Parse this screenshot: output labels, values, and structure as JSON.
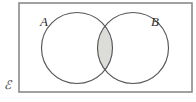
{
  "figure": {
    "kind": "venn-diagram",
    "background_color": "#ffffff"
  },
  "universe": {
    "label": "ℰ",
    "label_name": "script-capital-e",
    "meaning": "universal set",
    "border_color": "#8a8a8a",
    "fill_color": "#ffffff",
    "rect": {
      "x": 19,
      "y": 3,
      "width": 173,
      "height": 89
    }
  },
  "sets": [
    {
      "label": "A",
      "name": "set-a",
      "stroke_color": "#555555",
      "fill_color": "none",
      "circle": {
        "cx": 77,
        "cy": 48,
        "r": 35.5
      },
      "label_position": {
        "x": 44,
        "y": 26
      }
    },
    {
      "label": "B",
      "name": "set-b",
      "stroke_color": "#555555",
      "fill_color": "none",
      "circle": {
        "cx": 133,
        "cy": 48,
        "r": 35.5
      },
      "label_position": {
        "x": 155,
        "y": 26
      }
    }
  ],
  "shaded_region": {
    "name": "intersection",
    "notation": "A ∩ B",
    "fill_color": "#dcdcd8",
    "stroke_color": "#555555"
  },
  "universe_label_position": {
    "x": 4,
    "y": 89
  }
}
